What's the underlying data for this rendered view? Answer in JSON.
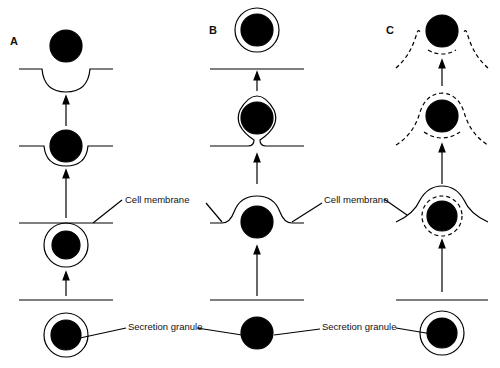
{
  "figure": {
    "panels": [
      {
        "id": "A",
        "label": "A"
      },
      {
        "id": "B",
        "label": "B"
      },
      {
        "id": "C",
        "label": "C"
      }
    ],
    "labels": {
      "cell_membrane_left": "Cell membrane",
      "cell_membrane_right": "Cell membrane",
      "secretion_granule_left": "Secretion granule",
      "secretion_granule_right": "Secretion granule"
    },
    "colors": {
      "ink": "#000000",
      "background": "#ffffff"
    }
  }
}
